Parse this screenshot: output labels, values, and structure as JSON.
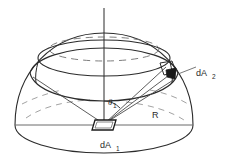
{
  "figure": {
    "background_color": "#ffffff",
    "line_color": "#2b2b2b",
    "fill_color": "#000000"
  },
  "labels": {
    "dA2": {
      "text": "dA",
      "subscript": "2",
      "x": 199,
      "y": 73
    },
    "dA1": {
      "text": "dA",
      "subscript": "1",
      "x": 104,
      "y": 145
    },
    "theta1": {
      "text": "θ",
      "subscript": "1",
      "x": 110,
      "y": 104
    },
    "radius": {
      "text": "R",
      "subscript": "",
      "x": 155,
      "y": 117
    }
  },
  "geometry": {
    "center": {
      "x": 104,
      "y": 125
    },
    "base_radius_x": 89,
    "base_radius_y": 26,
    "dome_height": 92,
    "axis_top_y": 8,
    "axis_bottom_y": 128,
    "bands": [
      {
        "name": "upper-dashed-ring",
        "cy": 52,
        "rx": 58,
        "ry": 13,
        "dashed": true
      },
      {
        "name": "dome-cap-ellipse",
        "cy": 58,
        "rx": 66,
        "ry": 17,
        "dashed": false
      },
      {
        "name": "mid-band-ellipse",
        "cy": 70,
        "rx": 72,
        "ry": 18,
        "dashed": false
      },
      {
        "name": "lower-hidden-arc",
        "cy": 96,
        "rx": 84,
        "ry": 24,
        "dashed": true
      }
    ],
    "patch_dA2": {
      "x": 170,
      "y": 76
    },
    "element_dA1": {
      "x": 104,
      "y": 123,
      "w": 20,
      "h": 9
    }
  },
  "icons": {
    "vertical_axis": "axis-line",
    "angle_arc": "arc-icon",
    "leader_line": "leader-line"
  }
}
